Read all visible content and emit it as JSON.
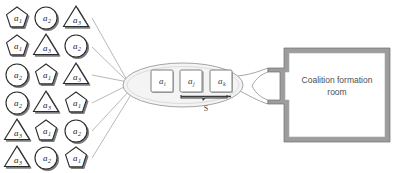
{
  "diagram": {
    "colors": {
      "agent_stroke": "#2b2b2b",
      "agent_fill": "#ffffff",
      "agent_shadow": "#7d7d7d",
      "ellipse_stroke": "#9a9a9a",
      "ellipse_fill": "#f4f4f4",
      "member_stroke": "#6f6f6f",
      "member_fill": "#ffffff",
      "connector": "#9e9e9e",
      "room_wall": "#8e8e8e",
      "room_fill": "#ffffff",
      "text": "#4d4d4d"
    }
  },
  "agent_pool": {
    "name": "agent-pool",
    "rows": [
      [
        {
          "shape": "pentagon",
          "label": "a",
          "sub": "1"
        },
        {
          "shape": "circle",
          "label": "a",
          "sub": "2"
        },
        {
          "shape": "triangle",
          "label": "a",
          "sub": "3"
        }
      ],
      [
        {
          "shape": "pentagon",
          "label": "a",
          "sub": "1"
        },
        {
          "shape": "triangle",
          "label": "a",
          "sub": "3"
        },
        {
          "shape": "circle",
          "label": "a",
          "sub": "2"
        }
      ],
      [
        {
          "shape": "circle",
          "label": "a",
          "sub": "2"
        },
        {
          "shape": "pentagon",
          "label": "a",
          "sub": "1"
        },
        {
          "shape": "triangle",
          "label": "a",
          "sub": "3"
        }
      ],
      [
        {
          "shape": "circle",
          "label": "a",
          "sub": "2"
        },
        {
          "shape": "triangle",
          "label": "a",
          "sub": "3"
        },
        {
          "shape": "pentagon",
          "label": "a",
          "sub": "1"
        }
      ],
      [
        {
          "shape": "triangle",
          "label": "a",
          "sub": "3"
        },
        {
          "shape": "pentagon",
          "label": "a",
          "sub": "1"
        },
        {
          "shape": "circle",
          "label": "a",
          "sub": "2"
        }
      ],
      [
        {
          "shape": "triangle",
          "label": "a",
          "sub": "3"
        },
        {
          "shape": "circle",
          "label": "a",
          "sub": "2"
        },
        {
          "shape": "pentagon",
          "label": "a",
          "sub": "1"
        }
      ]
    ]
  },
  "coalition": {
    "name": "coalition-ellipse",
    "members": [
      {
        "label": "a",
        "sub": "i"
      },
      {
        "label": "a",
        "sub": "j"
      },
      {
        "label": "a",
        "sub": "k"
      }
    ],
    "set_label": "S"
  },
  "room": {
    "name": "coalition-formation-room",
    "line1": "Coalition formation",
    "line2": "room"
  }
}
